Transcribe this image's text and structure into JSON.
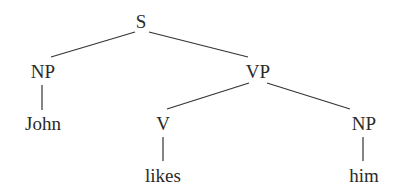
{
  "diagram": {
    "type": "syntax-tree",
    "nodes": {
      "s": {
        "label": "S",
        "x": 141,
        "y": 12
      },
      "np_subject": {
        "label": "NP",
        "x": 43,
        "y": 61
      },
      "vp": {
        "label": "VP",
        "x": 258,
        "y": 61
      },
      "john": {
        "label": "John",
        "x": 43,
        "y": 113
      },
      "v": {
        "label": "V",
        "x": 163,
        "y": 113
      },
      "np_object": {
        "label": "NP",
        "x": 364,
        "y": 113
      },
      "likes": {
        "label": "likes",
        "x": 163,
        "y": 165
      },
      "him": {
        "label": "him",
        "x": 364,
        "y": 165
      }
    },
    "edges": [
      {
        "from": "S",
        "to": "NP"
      },
      {
        "from": "S",
        "to": "VP"
      },
      {
        "from": "NP",
        "to": "John"
      },
      {
        "from": "VP",
        "to": "V"
      },
      {
        "from": "VP",
        "to": "NP"
      },
      {
        "from": "V",
        "to": "likes"
      },
      {
        "from": "NP",
        "to": "him"
      }
    ]
  }
}
